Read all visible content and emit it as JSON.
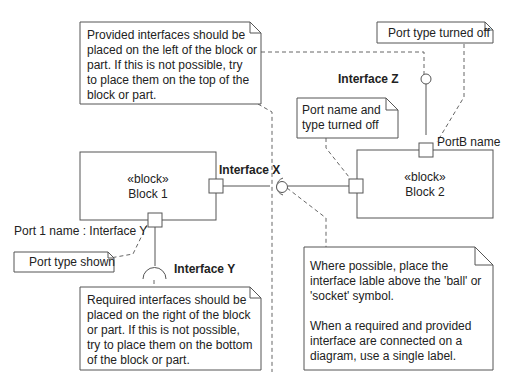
{
  "notes": {
    "provided": {
      "lines": [
        "Provided interfaces should be",
        "placed on the left of the block or",
        "part. If this is not possible, try",
        "to place them on the top of the",
        "block or part."
      ]
    },
    "port_type_off": {
      "lines": [
        "Port type turned off"
      ]
    },
    "port_name_type_off": {
      "lines": [
        "Port name and",
        "type turned off"
      ]
    },
    "port_type_shown": {
      "lines": [
        "Port type shown"
      ]
    },
    "required": {
      "lines": [
        "Required interfaces should be",
        "placed on the right of the block",
        "or part. If this is not possible,",
        "try to place them on the bottom",
        "of the block or part."
      ]
    },
    "label_placement": {
      "lines": [
        "Where possible, place the",
        "interface lable above the 'ball' or",
        "'socket' symbol.",
        "",
        "When a required and provided",
        "interface are connected on a",
        "diagram, use a single label."
      ]
    }
  },
  "blocks": {
    "block1": {
      "stereotype": "«block»",
      "name": "Block 1"
    },
    "block2": {
      "stereotype": "«block»",
      "name": "Block 2"
    }
  },
  "interfaces": {
    "x": "Interface X",
    "y": "Interface Y",
    "z": "Interface Z"
  },
  "ports": {
    "port1_label": "Port 1 name : Interface Y",
    "portB_label": "PortB name"
  }
}
